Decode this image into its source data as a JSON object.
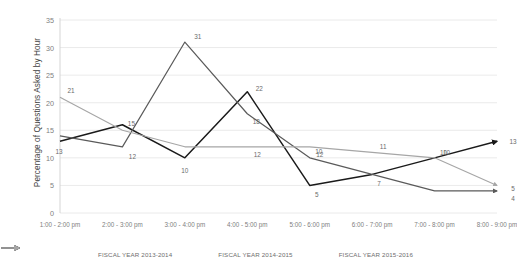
{
  "chart_data": {
    "type": "line",
    "title": "",
    "xlabel": "",
    "ylabel": "Percentage of Questions Asked by Hour",
    "categories": [
      "1:00 - 2:00 pm",
      "2:00 - 3:00 pm",
      "3:00 - 4:00 pm",
      "4:00 - 5:00 pm",
      "5:00 - 6:00 pm",
      "6:00 - 7:00 pm",
      "7:00 - 8:00 pm",
      "8:00 - 9:00 pm"
    ],
    "ylim": [
      0,
      35
    ],
    "yticks": [
      0,
      5,
      10,
      15,
      20,
      25,
      30,
      35
    ],
    "grid": true,
    "legend_position": "bottom",
    "series": [
      {
        "name": "FISCAL YEAR 2013-2014",
        "color": "#1a1a1a",
        "values": [
          13,
          16,
          10,
          22,
          5,
          7,
          10,
          13
        ],
        "labels": [
          "13",
          "16",
          "10",
          "22",
          "5",
          "7",
          "10",
          "13"
        ]
      },
      {
        "name": "FISCAL YEAR 2014-2015",
        "color": "#5a5a5a",
        "values": [
          14,
          12,
          31,
          18,
          10,
          7,
          4,
          4
        ],
        "labels": [
          "14",
          "12",
          "31",
          "18",
          "10",
          "7",
          "4",
          "4"
        ]
      },
      {
        "name": "FISCAL YEAR 2015-2016",
        "color": "#a6a6a6",
        "values": [
          21,
          15,
          12,
          12,
          12,
          11,
          10,
          5
        ],
        "labels": [
          "21",
          "15",
          "12",
          "12",
          "12",
          "11",
          "10",
          "5"
        ]
      }
    ]
  },
  "axis": {
    "y_title": "Percentage of Questions Asked by Hour",
    "y_ticks": [
      "35",
      "30",
      "25",
      "20",
      "15",
      "10",
      "5",
      "0"
    ],
    "x_ticks": [
      "1:00 - 2:00 pm",
      "2:00 - 3:00 pm",
      "3:00 - 4:00 pm",
      "4:00 - 5:00 pm",
      "5:00 - 6:00 pm",
      "6:00 - 7:00 pm",
      "7:00 - 8:00 pm",
      "8:00 - 9:00 pm"
    ]
  },
  "legend": {
    "items": [
      {
        "label": "FISCAL YEAR 2013-2014",
        "color": "#1a1a1a"
      },
      {
        "label": "FISCAL YEAR 2014-2015",
        "color": "#5a5a5a"
      },
      {
        "label": "FISCAL YEAR 2015-2016",
        "color": "#a6a6a6"
      }
    ]
  },
  "data_labels": {
    "s1": [
      "13",
      "",
      "10",
      "22",
      "5",
      "7",
      "10",
      "13"
    ],
    "s2": [
      "",
      "12",
      "31",
      "18",
      "10",
      "",
      "",
      "4"
    ],
    "s3": [
      "21",
      "15",
      "",
      "12",
      "12",
      "11",
      "10",
      "5"
    ]
  }
}
